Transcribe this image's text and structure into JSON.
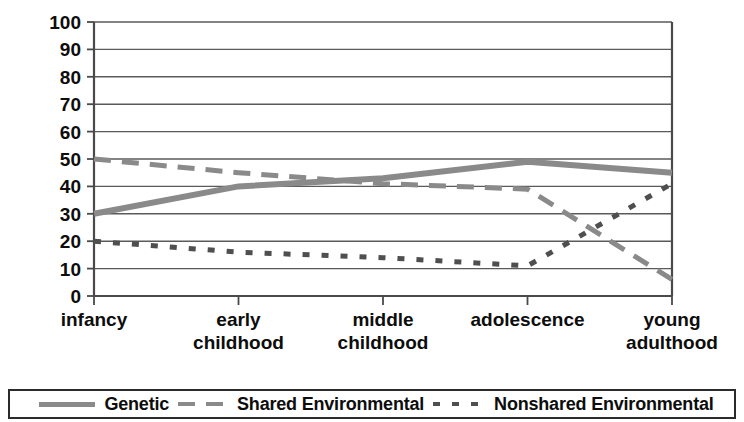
{
  "chart_data": {
    "type": "line",
    "title": "",
    "subtitle": "",
    "xlabel": "",
    "ylabel": "",
    "ylim": [
      0,
      100
    ],
    "ytick_step": 10,
    "yticks": [
      "100",
      "90",
      "80",
      "70",
      "60",
      "50",
      "40",
      "30",
      "20",
      "10",
      "0"
    ],
    "grid": true,
    "legend_position": "bottom",
    "categories": [
      "infancy",
      "early childhood",
      "middle childhood",
      "adolescence",
      "young adulthood"
    ],
    "category_lines": [
      [
        "infancy"
      ],
      [
        "early",
        "childhood"
      ],
      [
        "middle",
        "childhood"
      ],
      [
        "adolescence"
      ],
      [
        "young",
        "adulthood"
      ]
    ],
    "series": [
      {
        "name": "Genetic",
        "style": "solid",
        "color": "#8a8a8a",
        "values": [
          30,
          40,
          43,
          49,
          45
        ]
      },
      {
        "name": "Shared Environmental",
        "style": "dashed",
        "color": "#8a8a8a",
        "values": [
          50,
          45,
          41,
          39,
          6
        ]
      },
      {
        "name": "Nonshared Environmental",
        "style": "dotted",
        "color": "#4f4f4f",
        "values": [
          20,
          16,
          14,
          11,
          41
        ]
      }
    ]
  },
  "legend": {
    "items": [
      {
        "label": "Genetic",
        "swatch": "solid-line-swatch"
      },
      {
        "label": "Shared Environmental",
        "swatch": "dashed-line-swatch"
      },
      {
        "label": "Nonshared Environmental",
        "swatch": "dotted-line-swatch"
      }
    ]
  }
}
